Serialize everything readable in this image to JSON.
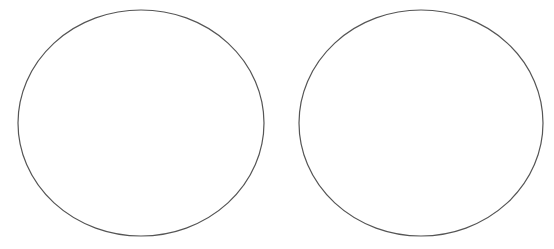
{
  "canvas": {
    "width": 554,
    "height": 249,
    "background": "#ffffff"
  },
  "shapes": [
    {
      "type": "ellipse",
      "cx": 141,
      "cy": 123,
      "rx": 123,
      "ry": 113,
      "stroke": "#555555",
      "stroke_width": 1.2,
      "fill": "none"
    },
    {
      "type": "ellipse",
      "cx": 421,
      "cy": 123,
      "rx": 122,
      "ry": 113,
      "stroke": "#555555",
      "stroke_width": 1.2,
      "fill": "none"
    }
  ]
}
